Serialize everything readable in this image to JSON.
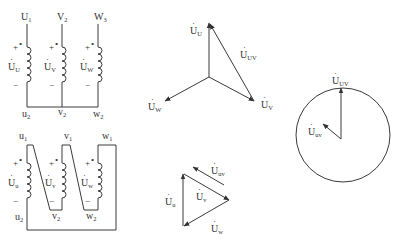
{
  "star_circuit": {
    "top_terminals": [
      {
        "main": "U",
        "sub": "1"
      },
      {
        "main": "V",
        "sub": "2"
      },
      {
        "main": "W",
        "sub": "3"
      }
    ],
    "bottom_terminals": [
      {
        "main": "u",
        "sub": "2"
      },
      {
        "main": "v",
        "sub": "2"
      },
      {
        "main": "w",
        "sub": "2"
      }
    ],
    "coil_voltages": [
      {
        "main": "U",
        "sub": "U"
      },
      {
        "main": "U",
        "sub": "V"
      },
      {
        "main": "U",
        "sub": "W"
      }
    ],
    "plus_sign": "+",
    "minus_sign": "−",
    "polarity_dot": "•"
  },
  "delta_circuit": {
    "top_terminals": [
      {
        "main": "u",
        "sub": "1"
      },
      {
        "main": "v",
        "sub": "1"
      },
      {
        "main": "w",
        "sub": "1"
      }
    ],
    "bottom_terminals": [
      {
        "main": "u",
        "sub": "2"
      },
      {
        "main": "v",
        "sub": "2"
      },
      {
        "main": "w",
        "sub": "2"
      }
    ],
    "coil_voltages": [
      {
        "main": "U",
        "sub": "u"
      },
      {
        "main": "U",
        "sub": "v"
      },
      {
        "main": "U",
        "sub": "w"
      }
    ],
    "plus_sign": "+",
    "minus_sign": "−",
    "polarity_dot": "•"
  },
  "star_phasor": {
    "labels": {
      "u": {
        "main": "U",
        "sub": "U"
      },
      "v": {
        "main": "U",
        "sub": "V"
      },
      "w": {
        "main": "U",
        "sub": "W"
      },
      "uv": {
        "main": "U",
        "sub": "UV"
      }
    }
  },
  "delta_phasor": {
    "labels": {
      "u": {
        "main": "U",
        "sub": "u"
      },
      "v": {
        "main": "U",
        "sub": "v"
      },
      "w": {
        "main": "U",
        "sub": "w"
      },
      "uv": {
        "main": "U",
        "sub": "uv"
      }
    }
  },
  "clock_diagram": {
    "labels": {
      "UV": {
        "main": "U",
        "sub": "UV"
      },
      "uv": {
        "main": "U",
        "sub": "uv"
      }
    }
  },
  "dot_accent": "·"
}
